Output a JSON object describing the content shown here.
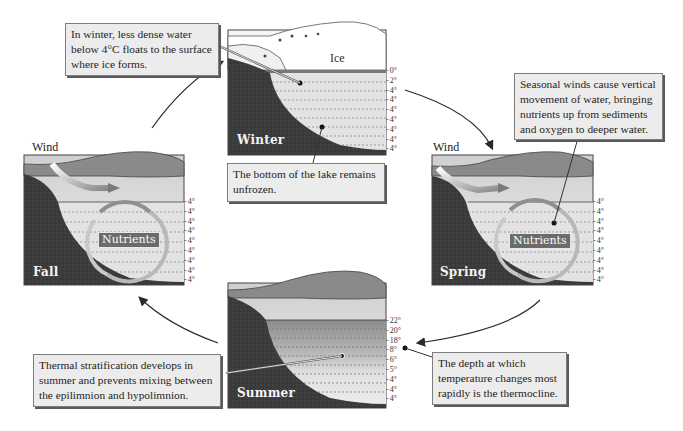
{
  "diagram": {
    "panels": {
      "winter": {
        "season": "Winter",
        "ice_label": "Ice",
        "temperatures": [
          "0°",
          "2°",
          "4°",
          "4°",
          "4°",
          "4°",
          "4°",
          "4°",
          "4°"
        ]
      },
      "spring": {
        "season": "Spring",
        "wind_label": "Wind",
        "nutrients_label": "Nutrients",
        "temperatures": [
          "4°",
          "4°",
          "4°",
          "4°",
          "4°",
          "4°",
          "4°",
          "4°",
          "4°"
        ]
      },
      "summer": {
        "season": "Summer",
        "temperatures": [
          "22°",
          "20°",
          "18°",
          "8°",
          "6°",
          "5°",
          "4°",
          "4°",
          "4°"
        ]
      },
      "fall": {
        "season": "Fall",
        "wind_label": "Wind",
        "nutrients_label": "Nutrients",
        "temperatures": [
          "4°",
          "4°",
          "4°",
          "4°",
          "4°",
          "4°",
          "4°",
          "4°",
          "4°"
        ]
      }
    },
    "callouts": {
      "winter_surface": [
        "In winter, less dense water",
        "below 4°C floats to the surface",
        "where ice forms."
      ],
      "winter_bottom": [
        "The bottom of the lake remains",
        "unfrozen."
      ],
      "spring_winds": [
        "Seasonal winds cause vertical",
        "movement of water, bringing",
        "nutrients up from sediments",
        "and oxygen to deeper water."
      ],
      "summer_stratification": [
        "Thermal stratification develops in",
        "summer and prevents mixing between",
        "the epilimnion and hypolimnion."
      ],
      "thermocline": [
        "The depth at which",
        "temperature changes most",
        "rapidly is the thermocline."
      ]
    },
    "cycle_order": [
      "Winter",
      "Spring",
      "Summer",
      "Fall"
    ],
    "colors": {
      "earth": "#3a3a3a",
      "water": "#e3e3e3",
      "land": "#8a8a8a",
      "callout_bg": "#ececec",
      "arrow": "#2a2a2a"
    }
  }
}
